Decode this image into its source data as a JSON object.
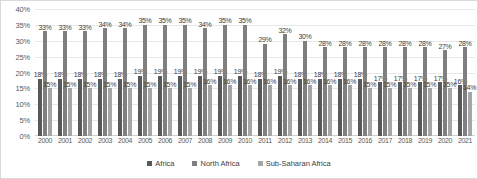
{
  "chart_data": {
    "type": "bar",
    "title": "",
    "xlabel": "",
    "ylabel": "",
    "ylim": [
      0,
      40
    ],
    "ytick_labels": [
      "40%",
      "35%",
      "30%",
      "25%",
      "20%",
      "15%",
      "10%",
      "5%",
      "0%"
    ],
    "ytick_values": [
      40,
      35,
      30,
      25,
      20,
      15,
      10,
      5,
      0
    ],
    "grid": true,
    "legend_position": "bottom",
    "value_label_suffix": "%",
    "categories": [
      "2000",
      "2001",
      "2002",
      "2003",
      "2004",
      "2005",
      "2006",
      "2007",
      "2008",
      "2009",
      "2010",
      "2011",
      "2012",
      "2013",
      "2014",
      "2015",
      "2016",
      "2017",
      "2018",
      "2019",
      "2020",
      "2021"
    ],
    "series": [
      {
        "name": "Africa",
        "color": "#595959",
        "values": [
          18,
          18,
          18,
          18,
          18,
          19,
          19,
          19,
          19,
          19,
          19,
          18,
          19,
          18,
          18,
          18,
          18,
          17,
          17,
          17,
          17,
          16
        ]
      },
      {
        "name": "North Africa",
        "color": "#7f7f7f",
        "values": [
          33,
          33,
          33,
          34,
          34,
          35,
          35,
          35,
          34,
          35,
          35,
          29,
          32,
          30,
          28,
          28,
          28,
          28,
          28,
          28,
          27,
          28
        ]
      },
      {
        "name": "Sub-Saharan Africa",
        "color": "#a6a6a6",
        "values": [
          15,
          15,
          15,
          15,
          15,
          15,
          15,
          15,
          16,
          16,
          16,
          16,
          16,
          16,
          16,
          16,
          15,
          15,
          15,
          15,
          15,
          14
        ]
      }
    ]
  }
}
